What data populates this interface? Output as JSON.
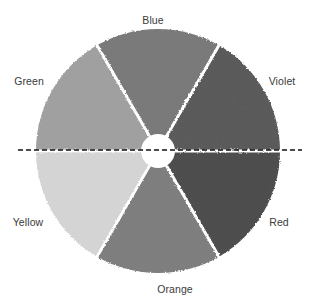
{
  "diagram": {
    "type": "color-wheel",
    "center": [
      158,
      151
    ],
    "outer_radius": 122,
    "inner_radius": 17,
    "gap_width": 3,
    "divider": {
      "style": "dashed",
      "y": 150,
      "x_start": 18,
      "x_end": 302,
      "color": "#111111"
    },
    "segments": [
      {
        "name": "Violet",
        "start_angle": -60,
        "end_angle": 0,
        "fill": "#5a5a5a",
        "label_pos": [
          282,
          81
        ]
      },
      {
        "name": "Red",
        "start_angle": 0,
        "end_angle": 60,
        "fill": "#4e4e4e",
        "label_pos": [
          279,
          222
        ]
      },
      {
        "name": "Orange",
        "start_angle": 60,
        "end_angle": 120,
        "fill": "#7e7e7e",
        "label_pos": [
          175,
          289
        ]
      },
      {
        "name": "Yellow",
        "start_angle": 120,
        "end_angle": 180,
        "fill": "#d4d4d4",
        "label_pos": [
          28,
          222
        ]
      },
      {
        "name": "Green",
        "start_angle": 180,
        "end_angle": 240,
        "fill": "#a0a0a0",
        "label_pos": [
          29,
          81
        ]
      },
      {
        "name": "Blue",
        "start_angle": 240,
        "end_angle": 300,
        "fill": "#7a7a7a",
        "label_pos": [
          153,
          20
        ]
      }
    ]
  },
  "labels": {
    "blue": "Blue",
    "green": "Green",
    "violet": "Violet",
    "yellow": "Yellow",
    "red": "Red",
    "orange": "Orange"
  }
}
